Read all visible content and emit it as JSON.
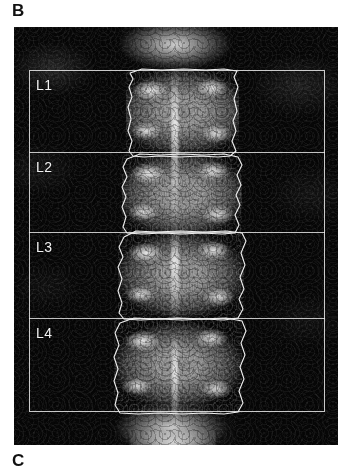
{
  "figure": {
    "panel_label_b": "B",
    "panel_label_c": "C",
    "modality": "DXA lumbar spine bone density scan",
    "orientation": "anteroposterior"
  },
  "scan": {
    "background_color": "#070707",
    "bone_color": "#d2d2d2",
    "roi_line_color": "#ebebeb",
    "contour_line_color": "#f0f0f0",
    "label_text_color": "#f2f2f2"
  },
  "roi": {
    "box": {
      "x": 15,
      "y": 43,
      "width": 296,
      "height": 342
    },
    "dividers": [
      125,
      205,
      291
    ],
    "regions": [
      {
        "id": "L1",
        "label": "L1",
        "label_x": 22,
        "label_y": 52,
        "band_top": 43,
        "band_bottom": 125
      },
      {
        "id": "L2",
        "label": "L2",
        "label_x": 22,
        "label_y": 134,
        "band_top": 125,
        "band_bottom": 205
      },
      {
        "id": "L3",
        "label": "L3",
        "label_x": 22,
        "label_y": 214,
        "band_top": 205,
        "band_bottom": 291
      },
      {
        "id": "L4",
        "label": "L4",
        "label_x": 22,
        "label_y": 300,
        "band_top": 291,
        "band_bottom": 385
      }
    ]
  },
  "vertebrae": [
    {
      "id": "L1",
      "x": 112,
      "y": 42,
      "width": 113,
      "height": 86,
      "contour": "M 116 46 L 119 52 L 115 60 L 118 70 L 114 80 L 117 92 L 114 104 L 118 114 L 115 124 L 119 129 L 130 130 L 146 129 L 166 130 L 186 129 L 204 130 L 216 129 L 222 124 L 218 114 L 222 104 L 219 94 L 223 84 L 220 72 L 224 60 L 220 50 L 223 44 L 210 42 L 192 43 L 170 42 L 148 43 L 128 42 Z"
    },
    {
      "id": "L2",
      "x": 108,
      "y": 126,
      "width": 120,
      "height": 82,
      "contour": "M 113 132 L 109 140 L 113 150 L 108 160 L 112 170 L 108 180 L 112 190 L 109 200 L 113 206 L 128 207 L 148 206 L 168 207 L 188 206 L 208 207 L 221 206 L 225 198 L 221 188 L 226 178 L 222 168 L 227 158 L 223 148 L 228 138 L 224 130 L 210 127 L 190 128 L 168 127 L 146 128 L 126 127 Z"
    },
    {
      "id": "L3",
      "x": 104,
      "y": 204,
      "width": 126,
      "height": 88,
      "contour": "M 110 210 L 105 220 L 109 230 L 104 240 L 108 252 L 104 264 L 108 276 L 105 286 L 110 292 L 126 293 L 146 292 L 168 293 L 190 292 L 210 293 L 224 291 L 229 282 L 225 272 L 230 262 L 226 250 L 231 238 L 227 226 L 232 214 L 228 206 L 212 204 L 190 205 L 166 204 L 142 205 L 122 204 Z"
    },
    {
      "id": "L4",
      "x": 100,
      "y": 290,
      "width": 128,
      "height": 96,
      "contour": "M 106 296 L 101 306 L 105 318 L 100 330 L 104 342 L 100 354 L 104 366 L 101 378 L 106 386 L 124 387 L 146 386 L 168 387 L 190 386 L 210 387 L 224 385 L 229 376 L 225 364 L 230 352 L 226 340 L 231 328 L 227 316 L 232 304 L 228 294 L 212 291 L 188 292 L 164 291 L 140 292 L 120 291 Z"
    }
  ]
}
